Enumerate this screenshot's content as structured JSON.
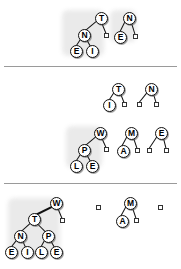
{
  "figure": {
    "background_color": "#ffffff",
    "node_fill": "#ffffff",
    "node_stroke": "#111111",
    "edge_color": "#111111",
    "divider_color": "#9a9a9a",
    "halo_color": "#d9d9d9"
  },
  "dividers": [
    {
      "name": "divider-1",
      "y": 66
    },
    {
      "name": "divider-2",
      "y": 183
    }
  ],
  "sections": [
    {
      "id": "section-1",
      "trees": [
        {
          "id": "tree-1-1",
          "root": "T",
          "nodes": [
            {
              "label": "T",
              "x": 95,
              "y": 12
            },
            {
              "label": "N",
              "x": 78,
              "y": 29
            },
            {
              "label": "E",
              "x": 70,
              "y": 45
            },
            {
              "label": "I",
              "x": 86,
              "y": 45
            }
          ],
          "nulls": [
            {
              "x": 104,
              "y": 33
            }
          ]
        },
        {
          "id": "tree-1-2",
          "root": "N",
          "nodes": [
            {
              "label": "N",
              "x": 123,
              "y": 12
            },
            {
              "label": "E",
              "x": 114,
              "y": 31
            }
          ],
          "nulls": [
            {
              "x": 133,
              "y": 34
            }
          ]
        }
      ]
    },
    {
      "id": "section-2",
      "rows": [
        {
          "id": "section-2-row-1",
          "trees": [
            {
              "id": "tree-2-1",
              "root": "T",
              "nodes": [
                {
                  "label": "T",
                  "x": 112,
                  "y": 83
                },
                {
                  "label": "I",
                  "x": 103,
                  "y": 99
                }
              ],
              "nulls": [
                {
                  "x": 122,
                  "y": 102
                }
              ]
            },
            {
              "id": "tree-2-2",
              "root": "N",
              "nodes": [
                {
                  "label": "N",
                  "x": 145,
                  "y": 83
                }
              ],
              "nulls": [
                {
                  "x": 137,
                  "y": 102
                },
                {
                  "x": 154,
                  "y": 102
                }
              ]
            }
          ]
        },
        {
          "id": "section-2-row-2",
          "trees": [
            {
              "id": "tree-2-3",
              "root": "W",
              "nodes": [
                {
                  "label": "W",
                  "x": 94,
                  "y": 127
                },
                {
                  "label": "P",
                  "x": 78,
                  "y": 144
                },
                {
                  "label": "L",
                  "x": 70,
                  "y": 160
                },
                {
                  "label": "E",
                  "x": 86,
                  "y": 160
                }
              ],
              "nulls": [
                {
                  "x": 104,
                  "y": 147
                }
              ]
            },
            {
              "id": "tree-2-4",
              "root": "M",
              "nodes": [
                {
                  "label": "M",
                  "x": 125,
                  "y": 127
                },
                {
                  "label": "A",
                  "x": 117,
                  "y": 145
                }
              ],
              "nulls": [
                {
                  "x": 135,
                  "y": 148
                }
              ]
            },
            {
              "id": "tree-2-5",
              "root": "E",
              "nodes": [
                {
                  "label": "E",
                  "x": 155,
                  "y": 127
                }
              ],
              "nulls": [
                {
                  "x": 147,
                  "y": 148
                },
                {
                  "x": 164,
                  "y": 148
                }
              ]
            }
          ]
        }
      ]
    },
    {
      "id": "section-3",
      "trees": [
        {
          "id": "tree-3-1",
          "root": "W",
          "nodes": [
            {
              "label": "W",
              "x": 50,
              "y": 197
            },
            {
              "label": "T",
              "x": 28,
              "y": 213
            },
            {
              "label": "N",
              "x": 14,
              "y": 230
            },
            {
              "label": "P",
              "x": 42,
              "y": 230
            },
            {
              "label": "E",
              "x": 5,
              "y": 246
            },
            {
              "label": "I",
              "x": 21,
              "y": 246
            },
            {
              "label": "L",
              "x": 35,
              "y": 246
            },
            {
              "label": "E",
              "x": 50,
              "y": 246
            }
          ],
          "nulls": [
            {
              "x": 60,
              "y": 218
            }
          ]
        },
        {
          "id": "tree-3-2",
          "root": null,
          "nodes": [],
          "nulls": [
            {
              "x": 96,
              "y": 205
            }
          ]
        },
        {
          "id": "tree-3-3",
          "root": "M",
          "nodes": [
            {
              "label": "M",
              "x": 124,
              "y": 197
            },
            {
              "label": "A",
              "x": 116,
              "y": 215
            }
          ],
          "nulls": [
            {
              "x": 134,
              "y": 218
            }
          ]
        },
        {
          "id": "tree-3-4",
          "root": null,
          "nodes": [],
          "nulls": [
            {
              "x": 158,
              "y": 205
            }
          ]
        }
      ]
    }
  ],
  "halos": [
    {
      "name": "halo-1",
      "x": 62,
      "y": 10,
      "w": 42,
      "h": 46
    },
    {
      "name": "halo-2",
      "x": 110,
      "y": 10,
      "w": 26,
      "h": 32
    },
    {
      "name": "halo-3",
      "x": 66,
      "y": 126,
      "w": 36,
      "h": 42
    },
    {
      "name": "halo-4",
      "x": 8,
      "y": 198,
      "w": 52,
      "h": 58
    }
  ],
  "edges": [
    {
      "tree": "tree-1-1",
      "from": "T",
      "to": "N",
      "x1": 96,
      "y1": 21,
      "x2": 84,
      "y2": 31
    },
    {
      "tree": "tree-1-1",
      "from": "T",
      "to": "null",
      "x1": 101,
      "y1": 21,
      "x2": 106,
      "y2": 33
    },
    {
      "tree": "tree-1-1",
      "from": "N",
      "to": "E",
      "x1": 81,
      "y1": 38,
      "x2": 75,
      "y2": 47
    },
    {
      "tree": "tree-1-1",
      "from": "N",
      "to": "I",
      "x1": 86,
      "y1": 38,
      "x2": 91,
      "y2": 47
    },
    {
      "tree": "tree-1-2",
      "from": "N",
      "to": "E",
      "x1": 125,
      "y1": 21,
      "x2": 119,
      "y2": 33
    },
    {
      "tree": "tree-1-2",
      "from": "N",
      "to": "null",
      "x1": 131,
      "y1": 21,
      "x2": 135,
      "y2": 34
    },
    {
      "tree": "tree-2-1",
      "from": "T",
      "to": "I",
      "x1": 114,
      "y1": 92,
      "x2": 108,
      "y2": 101
    },
    {
      "tree": "tree-2-1",
      "from": "T",
      "to": "null",
      "x1": 120,
      "y1": 92,
      "x2": 124,
      "y2": 102
    },
    {
      "tree": "tree-2-2",
      "from": "N",
      "to": "null1",
      "x1": 147,
      "y1": 92,
      "x2": 139,
      "y2": 102
    },
    {
      "tree": "tree-2-2",
      "from": "N",
      "to": "null2",
      "x1": 153,
      "y1": 92,
      "x2": 156,
      "y2": 102
    },
    {
      "tree": "tree-2-3",
      "from": "W",
      "to": "P",
      "x1": 96,
      "y1": 136,
      "x2": 84,
      "y2": 146
    },
    {
      "tree": "tree-2-3",
      "from": "W",
      "to": "null",
      "x1": 101,
      "y1": 136,
      "x2": 106,
      "y2": 147
    },
    {
      "tree": "tree-2-3",
      "from": "P",
      "to": "L",
      "x1": 81,
      "y1": 153,
      "x2": 75,
      "y2": 162
    },
    {
      "tree": "tree-2-3",
      "from": "P",
      "to": "E",
      "x1": 86,
      "y1": 153,
      "x2": 91,
      "y2": 162
    },
    {
      "tree": "tree-2-4",
      "from": "M",
      "to": "A",
      "x1": 127,
      "y1": 136,
      "x2": 121,
      "y2": 147
    },
    {
      "tree": "tree-2-4",
      "from": "M",
      "to": "null",
      "x1": 133,
      "y1": 136,
      "x2": 137,
      "y2": 148
    },
    {
      "tree": "tree-2-5",
      "from": "E",
      "to": "null1",
      "x1": 157,
      "y1": 136,
      "x2": 149,
      "y2": 148
    },
    {
      "tree": "tree-2-5",
      "from": "E",
      "to": "null2",
      "x1": 163,
      "y1": 136,
      "x2": 166,
      "y2": 148
    },
    {
      "tree": "tree-3-1",
      "from": "W",
      "to": "T",
      "x1": 52,
      "y1": 206,
      "x2": 34,
      "y2": 215
    },
    {
      "tree": "tree-3-1",
      "from": "W",
      "to": "null",
      "x1": 57,
      "y1": 206,
      "x2": 62,
      "y2": 218
    },
    {
      "tree": "tree-3-1",
      "from": "T",
      "to": "N",
      "x1": 31,
      "y1": 222,
      "x2": 20,
      "y2": 232
    },
    {
      "tree": "tree-3-1",
      "from": "T",
      "to": "P",
      "x1": 36,
      "y1": 222,
      "x2": 46,
      "y2": 232
    },
    {
      "tree": "tree-3-1",
      "from": "N",
      "to": "E",
      "x1": 17,
      "y1": 239,
      "x2": 10,
      "y2": 248
    },
    {
      "tree": "tree-3-1",
      "from": "N",
      "to": "I",
      "x1": 22,
      "y1": 239,
      "x2": 26,
      "y2": 248
    },
    {
      "tree": "tree-3-1",
      "from": "P",
      "to": "L",
      "x1": 45,
      "y1": 239,
      "x2": 40,
      "y2": 248
    },
    {
      "tree": "tree-3-1",
      "from": "P",
      "to": "E",
      "x1": 50,
      "y1": 239,
      "x2": 55,
      "y2": 248
    },
    {
      "tree": "tree-3-3",
      "from": "M",
      "to": "A",
      "x1": 126,
      "y1": 206,
      "x2": 120,
      "y2": 217
    },
    {
      "tree": "tree-3-3",
      "from": "M",
      "to": "null",
      "x1": 132,
      "y1": 206,
      "x2": 136,
      "y2": 218
    }
  ]
}
